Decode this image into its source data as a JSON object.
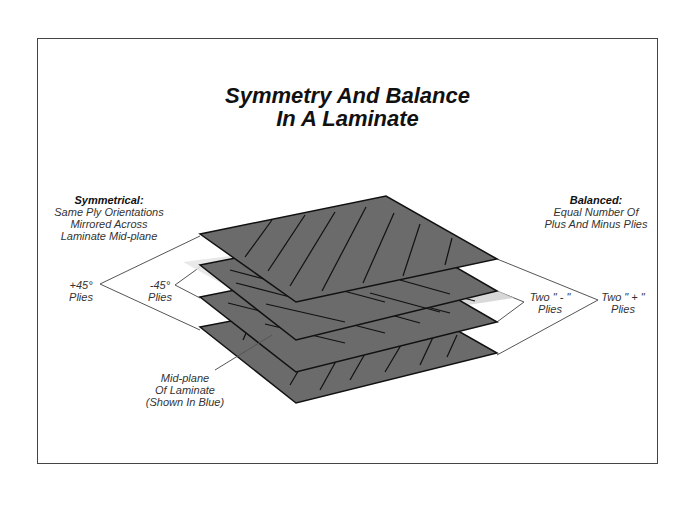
{
  "title": {
    "line1": "Symmetry And Balance",
    "line2": "In A Laminate"
  },
  "left_note": {
    "heading": "Symmetrical:",
    "line1": "Same Ply Orientations",
    "line2": "Mirrored Across",
    "line3": "Laminate Mid-plane"
  },
  "right_note": {
    "heading": "Balanced:",
    "line1": "Equal Number Of",
    "line2": "Plus And Minus Plies"
  },
  "callouts": {
    "plus45": {
      "line1": "+45°",
      "line2": "Plies"
    },
    "minus45": {
      "line1": "-45°",
      "line2": "Plies"
    },
    "two_minus": {
      "line1": "Two \" - \"",
      "line2": "Plies"
    },
    "two_plus": {
      "line1": "Two \" + \"",
      "line2": "Plies"
    },
    "midplane": {
      "line1": "Mid-plane",
      "line2": "Of Laminate",
      "line3": "(Shown In Blue)"
    }
  },
  "plies": [
    {
      "position": 1,
      "orientation": "+45°"
    },
    {
      "position": 2,
      "orientation": "-45°"
    },
    {
      "position": 3,
      "orientation": "-45°"
    },
    {
      "position": 4,
      "orientation": "+45°"
    }
  ],
  "colors": {
    "ply_fill": "#6b6b6b",
    "ply_edge": "#111111",
    "midplane": "#d8d8d8",
    "leader": "#555555",
    "frame": "#444444"
  }
}
